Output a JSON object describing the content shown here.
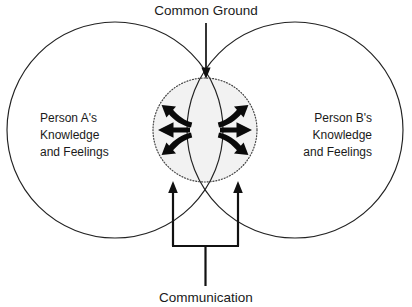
{
  "diagram": {
    "title_top": "Common Ground",
    "title_bottom": "Communication",
    "left_circle": {
      "lines": [
        "Person A's",
        "Knowledge",
        "and Feelings"
      ]
    },
    "right_circle": {
      "lines": [
        "Person B's",
        "Knowledge",
        "and Feelings"
      ]
    },
    "colors": {
      "stroke": "#222222",
      "overlap_fill": "#f2f2f2",
      "arrow": "#0a0a0a",
      "text": "#1a1a1a",
      "background": "#ffffff"
    },
    "icons": {
      "down_arrow": "arrow-down-icon",
      "up_arrow_left": "arrow-up-icon",
      "up_arrow_right": "arrow-up-icon",
      "radiating_left": "radiating-arrows-left-icon",
      "radiating_right": "radiating-arrows-right-icon"
    }
  }
}
